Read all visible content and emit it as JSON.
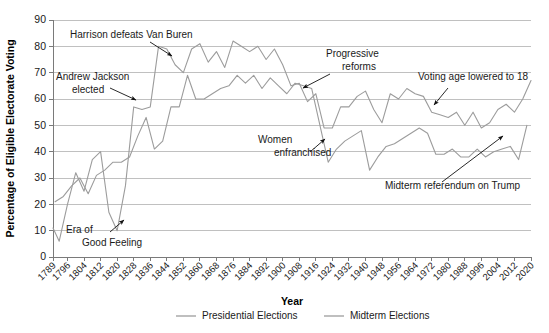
{
  "chart_data": {
    "type": "line",
    "title": "",
    "xlabel": "Year",
    "ylabel": "Percentage of Eligible Electorate Voting",
    "ylim": [
      0,
      90
    ],
    "ytick_step": 10,
    "yticks": [
      0,
      10,
      20,
      30,
      40,
      50,
      60,
      70,
      80,
      90
    ],
    "xlim": [
      1789,
      2020
    ],
    "xticks": [
      1789,
      1796,
      1804,
      1812,
      1820,
      1828,
      1836,
      1844,
      1852,
      1860,
      1868,
      1876,
      1884,
      1892,
      1900,
      1908,
      1916,
      1924,
      1932,
      1940,
      1948,
      1956,
      1964,
      1972,
      1980,
      1988,
      1996,
      2004,
      2012,
      2020
    ],
    "grid": true,
    "legend_position": "bottom",
    "series": [
      {
        "name": "Presidential Elections",
        "color": "#9c9c9c",
        "x": [
          1789,
          1792,
          1796,
          1800,
          1804,
          1808,
          1812,
          1816,
          1820,
          1824,
          1828,
          1832,
          1836,
          1840,
          1844,
          1848,
          1852,
          1856,
          1860,
          1864,
          1868,
          1872,
          1876,
          1880,
          1884,
          1888,
          1892,
          1896,
          1900,
          1904,
          1908,
          1912,
          1916,
          1920,
          1924,
          1928,
          1932,
          1936,
          1940,
          1944,
          1948,
          1952,
          1956,
          1960,
          1964,
          1968,
          1972,
          1976,
          1980,
          1984,
          1988,
          1992,
          1996,
          2000,
          2004,
          2008,
          2012,
          2016,
          2020
        ],
        "values": [
          11,
          6,
          20,
          32,
          25,
          37,
          40,
          17,
          10,
          27,
          57,
          56,
          57,
          80,
          79,
          73,
          70,
          79,
          81,
          74,
          78,
          72,
          82,
          80,
          78,
          80,
          75,
          79,
          73,
          65,
          66,
          59,
          62,
          49,
          49,
          57,
          57,
          61,
          63,
          56,
          51,
          62,
          60,
          64,
          62,
          61,
          55,
          54,
          53,
          55,
          50,
          55,
          49,
          51,
          56,
          58,
          55,
          60,
          67
        ]
      },
      {
        "name": "Midterm Elections",
        "color": "#9c9c9c",
        "x": [
          1790,
          1794,
          1798,
          1802,
          1806,
          1810,
          1814,
          1818,
          1822,
          1826,
          1830,
          1834,
          1838,
          1842,
          1846,
          1850,
          1854,
          1858,
          1862,
          1866,
          1870,
          1874,
          1878,
          1882,
          1886,
          1890,
          1894,
          1898,
          1902,
          1906,
          1910,
          1914,
          1918,
          1922,
          1926,
          1930,
          1934,
          1938,
          1942,
          1946,
          1950,
          1954,
          1958,
          1962,
          1966,
          1970,
          1974,
          1978,
          1982,
          1986,
          1990,
          1994,
          1998,
          2002,
          2006,
          2010,
          2014,
          2018
        ],
        "values": [
          21,
          23,
          27,
          30,
          24,
          31,
          33,
          36,
          36,
          38,
          46,
          53,
          41,
          44,
          57,
          57,
          69,
          60,
          60,
          62,
          64,
          65,
          69,
          66,
          69,
          64,
          68,
          65,
          62,
          66,
          65,
          64,
          50,
          36,
          41,
          44,
          46,
          48,
          33,
          38,
          42,
          43,
          45,
          47,
          49,
          47,
          39,
          39,
          41,
          38,
          38,
          41,
          38,
          40,
          41,
          42,
          37,
          50
        ]
      }
    ],
    "annotations": [
      {
        "name": "harrison-annotation",
        "text": "Harrison defeats Van Buren",
        "text_x": 70,
        "text_y": 38,
        "arrow_from_x": 150,
        "arrow_from_y": 42,
        "arrow_to_x": 172,
        "arrow_to_y": 56
      },
      {
        "name": "jackson-annotation",
        "line1": "Andrew Jackson",
        "line2": "elected",
        "text_x": 56,
        "text_y": 80,
        "arrow_from_x": 110,
        "arrow_from_y": 88,
        "arrow_to_x": 136,
        "arrow_to_y": 100
      },
      {
        "name": "era-good-feeling-annotation",
        "line1": "Era of",
        "line2": "Good Feeling",
        "text_x": 66,
        "text_y": 233,
        "arrow_from_x": 110,
        "arrow_from_y": 232,
        "arrow_to_x": 124,
        "arrow_to_y": 220
      },
      {
        "name": "women-enfranchised-annotation",
        "line1": "Women",
        "line2": "enfranchised",
        "text_x": 258,
        "text_y": 143,
        "arrow_from_x": 310,
        "arrow_from_y": 152,
        "arrow_to_x": 325,
        "arrow_to_y": 139
      },
      {
        "name": "progressive-reforms-annotation",
        "line1": "Progressive",
        "line2": "reforms",
        "text_x": 326,
        "text_y": 57,
        "arrow_from_x": 330,
        "arrow_from_y": 74,
        "arrow_to_x": 303,
        "arrow_to_y": 88
      },
      {
        "name": "voting-age-annotation",
        "text": "Voting age lowered to 18",
        "text_x": 418,
        "text_y": 80,
        "arrow_from_x": 448,
        "arrow_from_y": 88,
        "arrow_to_x": 434,
        "arrow_to_y": 105
      },
      {
        "name": "trump-midterm-annotation",
        "text": "Midterm referendum on Trump",
        "text_x": 385,
        "text_y": 189,
        "arrow_from_x": 442,
        "arrow_from_y": 182,
        "arrow_to_x": 503,
        "arrow_to_y": 136
      }
    ]
  },
  "legend": {
    "items": [
      {
        "label": "Presidential Elections",
        "color": "#9c9c9c"
      },
      {
        "label": "Midterm Elections",
        "color": "#9c9c9c"
      }
    ]
  }
}
